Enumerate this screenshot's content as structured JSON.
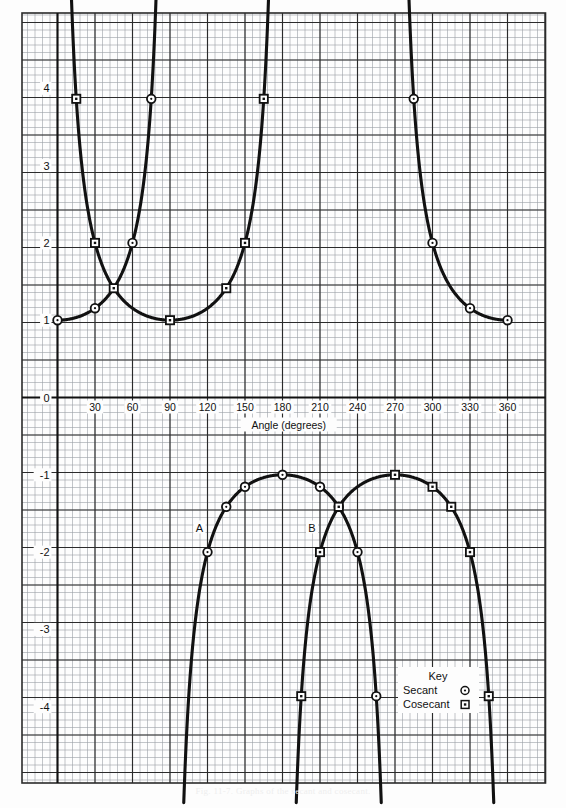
{
  "figure": {
    "caption": "Fig. 11-7.  Graphs of the secant and cosecant.",
    "background": "#fdfdfd",
    "ink_color": "#111111",
    "grid_minor_color": "#9aa0a6",
    "grid_major_color": "#2b2b2b"
  },
  "axis": {
    "x_title": "Angle  (degrees)",
    "x_ticks": [
      "30",
      "60",
      "90",
      "120",
      "150",
      "180",
      "210",
      "240",
      "270",
      "300",
      "330",
      "360"
    ],
    "x_tick_values": [
      30,
      60,
      90,
      120,
      150,
      180,
      210,
      240,
      270,
      300,
      330,
      360
    ],
    "y_ticks": [
      "4",
      "3",
      "2",
      "1",
      "0",
      "-1",
      "-2",
      "-3",
      "-4"
    ],
    "y_tick_values": [
      4,
      3,
      2,
      1,
      0,
      -1,
      -2,
      -3,
      -4
    ],
    "zero_label": "0"
  },
  "annotations": {
    "curve_a_label": "A",
    "curve_b_label": "B"
  },
  "legend": {
    "title": "Key",
    "entries": [
      {
        "label": "Secant",
        "marker": "circle-marker"
      },
      {
        "label": "Cosecant",
        "marker": "square-marker"
      }
    ]
  },
  "chart_data": {
    "type": "line",
    "title": "Graphs of the secant and cosecant",
    "xlabel": "Angle  (degrees)",
    "ylabel": "",
    "xlim": [
      -12,
      372
    ],
    "ylim": [
      -4.9,
      4.9
    ],
    "grid": true,
    "legend_position": "lower-right",
    "asymptotes_deg": [
      90,
      180,
      270
    ],
    "series": [
      {
        "name": "Secant",
        "marker": "circle",
        "annotation": "A",
        "branches": [
          {
            "range_deg": [
              0,
              84
            ],
            "x": [
              0,
              15,
              30,
              45,
              60,
              70,
              75,
              80,
              84
            ],
            "y": [
              1.0,
              1.035,
              1.155,
              1.414,
              2.0,
              2.924,
              3.864,
              5.759,
              9.57
            ]
          },
          {
            "range_deg": [
              96,
              180
            ],
            "x": [
              96,
              100,
              105,
              110,
              120,
              135,
              150,
              165,
              180
            ],
            "y": [
              -9.57,
              -5.759,
              -3.864,
              -2.924,
              -2.0,
              -1.414,
              -1.155,
              -1.035,
              -1.0
            ]
          },
          {
            "range_deg": [
              180,
              264
            ],
            "x": [
              180,
              195,
              210,
              225,
              240,
              250,
              255,
              260,
              264
            ],
            "y": [
              -1.0,
              -1.035,
              -1.155,
              -1.414,
              -2.0,
              -2.924,
              -3.864,
              -5.759,
              -9.57
            ]
          },
          {
            "range_deg": [
              276,
              360
            ],
            "x": [
              276,
              280,
              285,
              290,
              300,
              315,
              330,
              345,
              360
            ],
            "y": [
              9.57,
              5.759,
              3.864,
              2.924,
              2.0,
              1.414,
              1.155,
              1.035,
              1.0
            ]
          }
        ],
        "markers": [
          {
            "x": 0,
            "y": 1.0
          },
          {
            "x": 30,
            "y": 1.155
          },
          {
            "x": 60,
            "y": 2.0
          },
          {
            "x": 75,
            "y": 3.864
          },
          {
            "x": 120,
            "y": -2.0
          },
          {
            "x": 135,
            "y": -1.414
          },
          {
            "x": 150,
            "y": -1.155
          },
          {
            "x": 180,
            "y": -1.0
          },
          {
            "x": 210,
            "y": -1.155
          },
          {
            "x": 225,
            "y": -1.414
          },
          {
            "x": 240,
            "y": -2.0
          },
          {
            "x": 255,
            "y": -3.864
          },
          {
            "x": 285,
            "y": 3.864
          },
          {
            "x": 300,
            "y": 2.0
          },
          {
            "x": 330,
            "y": 1.155
          },
          {
            "x": 360,
            "y": 1.0
          }
        ]
      },
      {
        "name": "Cosecant",
        "marker": "square",
        "annotation": "B",
        "branches": [
          {
            "range_deg": [
              6,
              174
            ],
            "x": [
              6,
              10,
              15,
              20,
              30,
              45,
              60,
              75,
              90,
              105,
              120,
              135,
              150,
              160,
              170,
              174
            ],
            "y": [
              9.57,
              5.759,
              3.864,
              2.924,
              2.0,
              1.414,
              1.155,
              1.035,
              1.0,
              1.035,
              1.155,
              1.414,
              2.0,
              2.924,
              5.759,
              9.57
            ]
          },
          {
            "range_deg": [
              186,
              354
            ],
            "x": [
              186,
              190,
              195,
              200,
              210,
              225,
              240,
              255,
              270,
              285,
              300,
              315,
              330,
              340,
              350,
              354
            ],
            "y": [
              -9.57,
              -5.759,
              -3.864,
              -2.924,
              -2.0,
              -1.414,
              -1.155,
              -1.035,
              -1.0,
              -1.035,
              -1.155,
              -1.414,
              -2.0,
              -2.924,
              -5.759,
              -9.57
            ]
          }
        ],
        "markers": [
          {
            "x": 15,
            "y": 3.864
          },
          {
            "x": 30,
            "y": 2.0
          },
          {
            "x": 45,
            "y": 1.414
          },
          {
            "x": 90,
            "y": 1.0
          },
          {
            "x": 135,
            "y": 1.414
          },
          {
            "x": 150,
            "y": 2.0
          },
          {
            "x": 165,
            "y": 3.864
          },
          {
            "x": 195,
            "y": -3.864
          },
          {
            "x": 210,
            "y": -2.0
          },
          {
            "x": 225,
            "y": -1.414
          },
          {
            "x": 270,
            "y": -1.0
          },
          {
            "x": 300,
            "y": -1.155
          },
          {
            "x": 315,
            "y": -1.414
          },
          {
            "x": 330,
            "y": -2.0
          },
          {
            "x": 345,
            "y": -3.864
          }
        ]
      }
    ]
  }
}
